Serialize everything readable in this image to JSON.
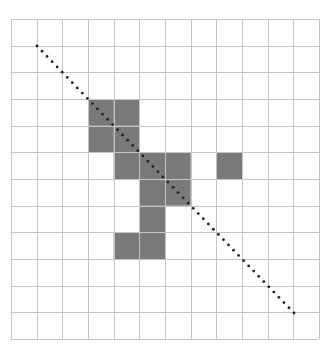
{
  "grid": {
    "cols": 12,
    "rows": 12,
    "left": 11,
    "top": 19,
    "right": 319,
    "bottom": 339,
    "line_color": "#c4c4c4",
    "background": "#ffffff"
  },
  "filled_cells": {
    "color": "#7a7a7a",
    "cells": [
      [
        3,
        3
      ],
      [
        4,
        3
      ],
      [
        3,
        4
      ],
      [
        4,
        4
      ],
      [
        4,
        5
      ],
      [
        5,
        5
      ],
      [
        6,
        5
      ],
      [
        8,
        5
      ],
      [
        5,
        6
      ],
      [
        6,
        6
      ],
      [
        5,
        7
      ],
      [
        4,
        8
      ],
      [
        5,
        8
      ]
    ]
  },
  "diagonal": {
    "x1": 37,
    "y1": 46,
    "x2": 294,
    "y2": 313,
    "color": "#222222",
    "dot_spacing": 7.3
  }
}
